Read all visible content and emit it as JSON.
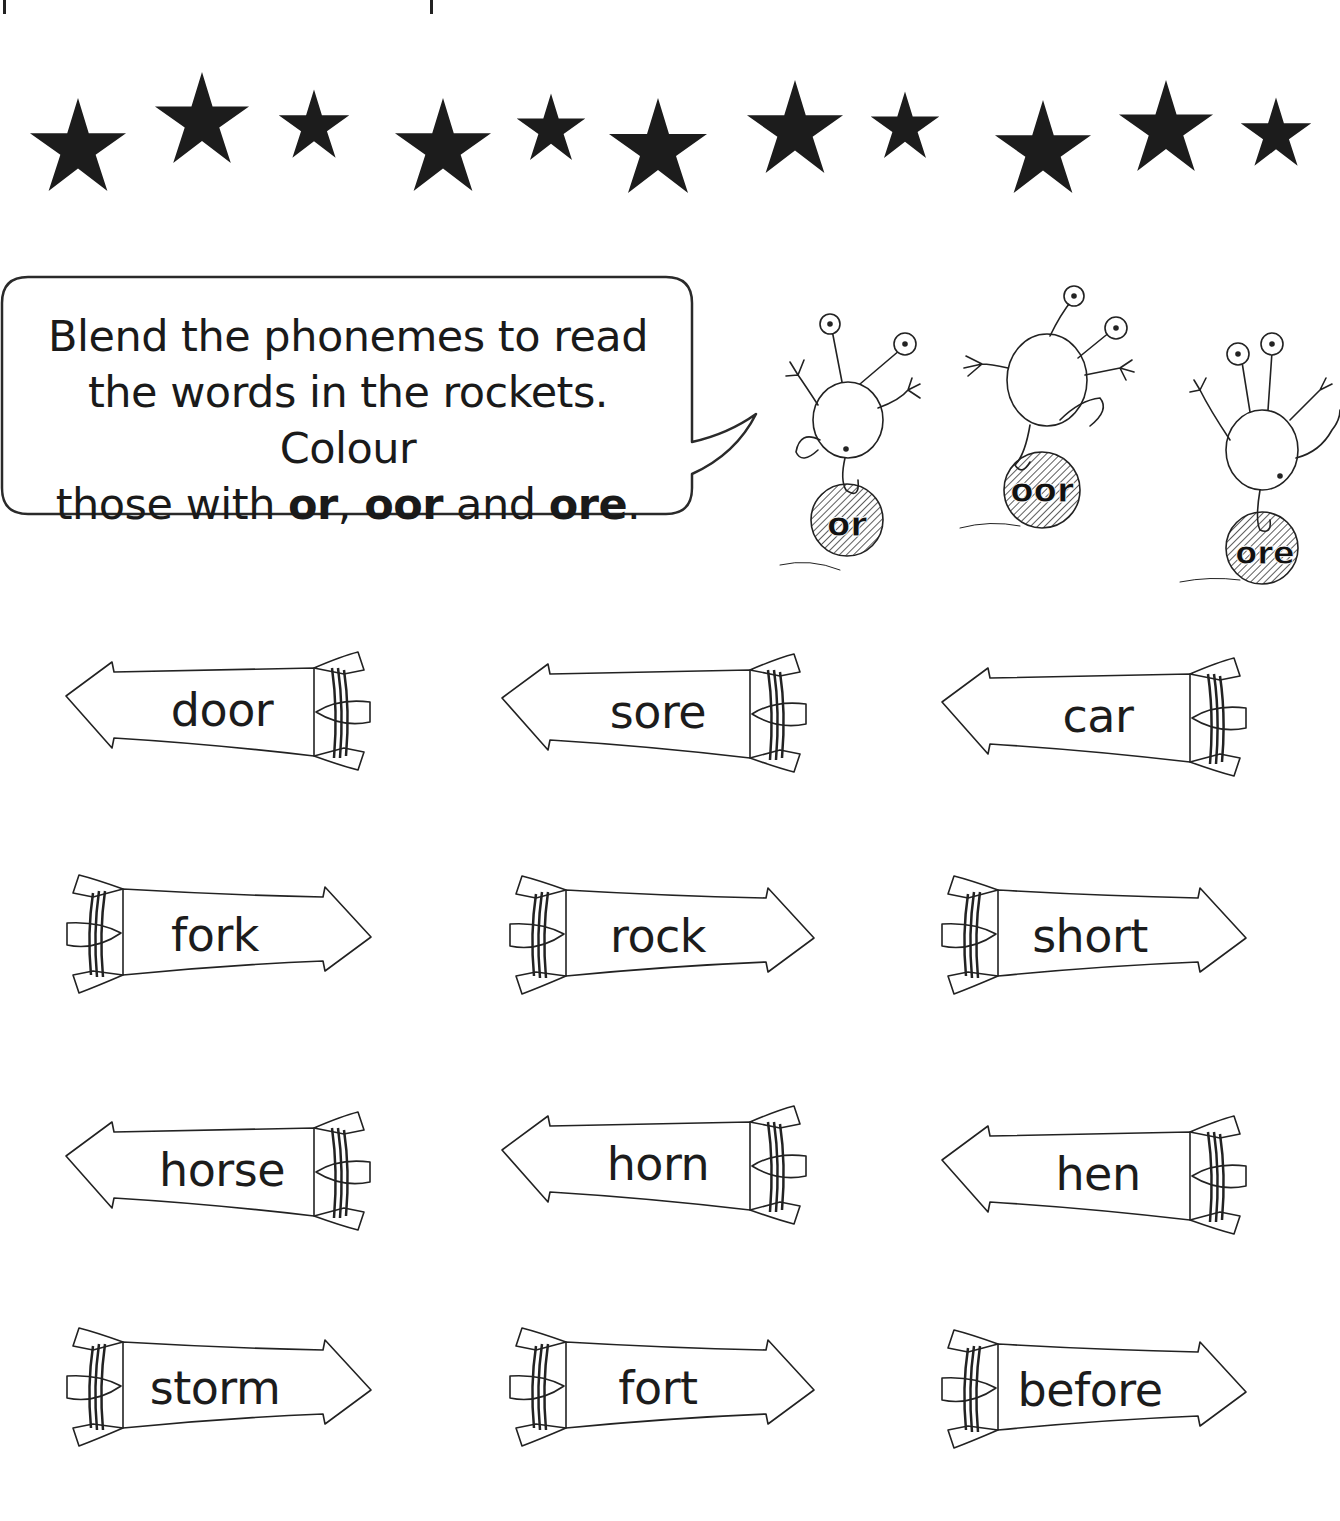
{
  "worksheet": {
    "instruction": {
      "line1": "Blend the phonemes to read",
      "line2": "the words in the rockets. Colour",
      "line3_prefix": "those with ",
      "grapheme_1": "or",
      "sep_1": ", ",
      "grapheme_2": "oor",
      "sep_2": " and ",
      "grapheme_3": "ore",
      "line3_suffix": "."
    },
    "creatures": [
      {
        "label": "or"
      },
      {
        "label": "oor"
      },
      {
        "label": "ore"
      }
    ],
    "stars_count": 12,
    "rockets": [
      {
        "word": "door",
        "direction": "left"
      },
      {
        "word": "sore",
        "direction": "left"
      },
      {
        "word": "car",
        "direction": "left"
      },
      {
        "word": "fork",
        "direction": "right"
      },
      {
        "word": "rock",
        "direction": "right"
      },
      {
        "word": "short",
        "direction": "right"
      },
      {
        "word": "horse",
        "direction": "left"
      },
      {
        "word": "horn",
        "direction": "left"
      },
      {
        "word": "hen",
        "direction": "left"
      },
      {
        "word": "storm",
        "direction": "right"
      },
      {
        "word": "fort",
        "direction": "right"
      },
      {
        "word": "before",
        "direction": "right"
      }
    ]
  },
  "colors": {
    "ink": "#1a1a1a",
    "paper": "#ffffff",
    "star": "#1c1c1c"
  }
}
